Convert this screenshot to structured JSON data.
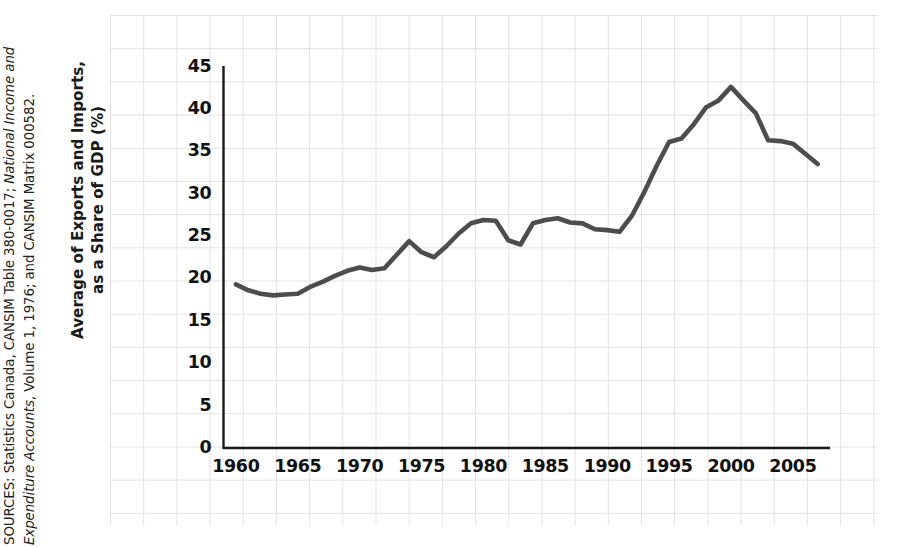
{
  "sources_note": {
    "prefix": "SOURCES: Statistics Canada, CANSIM Table 380-0017; ",
    "italic": "National Income and Expenditure Accounts",
    "suffix": ", Volume 1, 1976; and CANSIM Matrix 000582.",
    "full_text": "SOURCES: Statistics Canada, CANSIM Table 380-0017; National Income and Expenditure Accounts, Volume 1, 1976; and CANSIM Matrix 000582."
  },
  "colors": {
    "line": "#4d4d4d",
    "axis": "#1a1a1a",
    "grid": "#e2e2e4",
    "text": "#111111",
    "background": "#ffffff"
  },
  "chart_data": {
    "type": "line",
    "title": "",
    "xlabel": "",
    "ylabel": "Average of Exports and Imports, as a Share of GDP (%)",
    "ylabel_line1": "Average of Exports and Imports,",
    "ylabel_line2": "as a Share of GDP (%)",
    "xlim": [
      1959,
      2008
    ],
    "ylim": [
      0,
      45
    ],
    "yticks": [
      0,
      5,
      10,
      15,
      20,
      25,
      30,
      35,
      40,
      45
    ],
    "ytick_labels": [
      "0",
      "5",
      "10",
      "15",
      "20",
      "25",
      "30",
      "35",
      "40",
      "45"
    ],
    "xticks": [
      1960,
      1965,
      1970,
      1975,
      1980,
      1985,
      1990,
      1995,
      2000,
      2005
    ],
    "xtick_labels": [
      "1960",
      "1965",
      "1970",
      "1975",
      "1980",
      "1985",
      "1990",
      "1995",
      "2000",
      "2005"
    ],
    "grid": true,
    "legend": false,
    "series": [
      {
        "name": "Average of Exports and Imports, as a Share of GDP (%)",
        "x": [
          1960,
          1961,
          1962,
          1963,
          1964,
          1965,
          1966,
          1967,
          1968,
          1969,
          1970,
          1971,
          1972,
          1973,
          1974,
          1975,
          1976,
          1977,
          1978,
          1979,
          1980,
          1981,
          1982,
          1983,
          1984,
          1985,
          1986,
          1987,
          1988,
          1989,
          1990,
          1991,
          1992,
          1993,
          1994,
          1995,
          1996,
          1997,
          1998,
          1999,
          2000,
          2001,
          2002,
          2003,
          2004,
          2005,
          2006,
          2007
        ],
        "values": [
          19.3,
          18.6,
          18.2,
          18.0,
          18.1,
          18.2,
          19.0,
          19.6,
          20.3,
          20.9,
          21.3,
          21.0,
          21.2,
          22.8,
          24.4,
          23.1,
          22.5,
          23.8,
          25.3,
          26.5,
          26.9,
          26.8,
          24.5,
          24.0,
          26.5,
          26.9,
          27.1,
          26.6,
          26.5,
          25.8,
          25.7,
          25.5,
          27.4,
          30.2,
          33.3,
          36.1,
          36.5,
          38.2,
          40.2,
          41.0,
          42.6,
          41.0,
          39.5,
          36.3,
          36.2,
          35.9,
          34.7,
          33.5
        ]
      }
    ]
  },
  "axis_titles": {
    "y_line1": "Average of Exports and Imports,",
    "y_line2": "as a Share of GDP (%)"
  }
}
